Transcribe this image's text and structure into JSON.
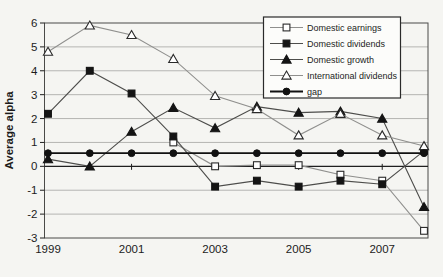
{
  "chart_data": {
    "type": "line",
    "title": "",
    "xlabel": "",
    "ylabel": "Average alpha",
    "x": [
      1999,
      2000,
      2001,
      2002,
      2003,
      2004,
      2005,
      2006,
      2007,
      2008
    ],
    "x_tick_labels": [
      "1999",
      "2001",
      "2003",
      "2005",
      "2007"
    ],
    "x_tick_years": [
      1999,
      2001,
      2003,
      2005,
      2007
    ],
    "y_ticks": [
      6,
      5,
      4,
      3,
      2,
      1,
      0,
      -1,
      -2,
      -3
    ],
    "ylim": [
      -3,
      6
    ],
    "grid": true,
    "legend_position": "top-right",
    "series": [
      {
        "name": "Domestic earnings",
        "marker": "square-open",
        "line_color": "#8f8f8d",
        "marker_color": "#ffffff",
        "marker_stroke": "#2a2a2a",
        "line_width": 1.1,
        "values": [
          null,
          null,
          null,
          1.0,
          0.0,
          0.05,
          0.05,
          -0.35,
          -0.6,
          -2.7
        ]
      },
      {
        "name": "Domestic dividends",
        "marker": "square-filled",
        "line_color": "#4d4d4b",
        "marker_color": "#141414",
        "marker_stroke": "#141414",
        "line_width": 1.1,
        "values": [
          2.2,
          4.0,
          3.05,
          1.25,
          -0.85,
          -0.6,
          -0.85,
          -0.6,
          -0.75,
          0.65
        ]
      },
      {
        "name": "Domestic growth",
        "marker": "triangle-filled",
        "line_color": "#4d4d4b",
        "marker_color": "#141414",
        "marker_stroke": "#141414",
        "line_width": 1.1,
        "values": [
          0.3,
          0.0,
          1.45,
          2.45,
          1.6,
          2.5,
          2.25,
          2.3,
          2.0,
          -1.7
        ]
      },
      {
        "name": "International dividends",
        "marker": "triangle-open",
        "line_color": "#8f8f8d",
        "marker_color": "#ffffff",
        "marker_stroke": "#2a2a2a",
        "line_width": 1.1,
        "values": [
          4.8,
          5.9,
          5.5,
          4.5,
          2.95,
          2.4,
          1.3,
          2.2,
          1.3,
          0.85
        ]
      },
      {
        "name": "gap",
        "marker": "circle-filled",
        "line_color": "#111111",
        "marker_color": "#111111",
        "marker_stroke": "#111111",
        "line_width": 1.8,
        "values": [
          0.55,
          0.55,
          0.55,
          0.55,
          0.55,
          0.55,
          0.55,
          0.55,
          0.55,
          0.55
        ]
      }
    ],
    "colors": {
      "grid": "#aeaeac",
      "axis": "#1f1f1f",
      "plot_border": "#4a4a48",
      "background": "#f5f5f2",
      "legend_background": "#fcfcfa",
      "legend_border": "#2a2a2a"
    }
  },
  "legend": {
    "items": [
      {
        "label": "Domestic earnings"
      },
      {
        "label": "Domestic dividends"
      },
      {
        "label": "Domestic growth"
      },
      {
        "label": "International dividends"
      },
      {
        "label": "gap"
      }
    ]
  },
  "axes": {
    "y_axis_title": "Average alpha"
  }
}
